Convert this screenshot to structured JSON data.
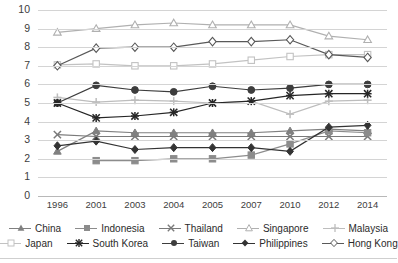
{
  "chart_data": {
    "type": "line",
    "title": "",
    "xlabel": "",
    "ylabel": "",
    "ylim": [
      0,
      10
    ],
    "ytick_step": 1,
    "grid": true,
    "legend_position": "bottom",
    "categories": [
      "1996",
      "2001",
      "2003",
      "2004",
      "2005",
      "2007",
      "2010",
      "2012",
      "2014"
    ],
    "yticks": [
      "0",
      "1",
      "2",
      "3",
      "4",
      "5",
      "6",
      "7",
      "8",
      "9",
      "10"
    ],
    "series": [
      {
        "name": "China",
        "marker": "triangle",
        "color": "#808080",
        "values": [
          2.4,
          3.5,
          3.4,
          3.4,
          3.4,
          3.4,
          3.5,
          3.6,
          3.5
        ]
      },
      {
        "name": "Indonesia",
        "marker": "square",
        "color": "#8c8c8c",
        "values": [
          null,
          1.9,
          1.9,
          2.0,
          2.0,
          2.2,
          2.8,
          3.5,
          3.4
        ]
      },
      {
        "name": "Thailand",
        "marker": "x",
        "color": "#7a7a7a",
        "values": [
          3.3,
          3.2,
          3.2,
          3.2,
          3.2,
          3.2,
          3.2,
          3.2,
          3.2
        ]
      },
      {
        "name": "Japan",
        "marker": "square-open",
        "color": "#c2c2c2",
        "values": [
          7.05,
          7.1,
          7.0,
          7.0,
          7.1,
          7.3,
          7.5,
          7.6,
          7.6
        ]
      },
      {
        "name": "South Korea",
        "marker": "star",
        "color": "#262626",
        "values": [
          5.0,
          4.2,
          4.3,
          4.5,
          5.0,
          5.1,
          5.4,
          5.5,
          5.5
        ]
      },
      {
        "name": "Taiwan",
        "marker": "circle-filled",
        "color": "#3d3d3d",
        "values": [
          5.0,
          5.95,
          5.7,
          5.6,
          5.9,
          5.7,
          5.8,
          6.0,
          6.0
        ]
      },
      {
        "name": "Singapore",
        "marker": "triangle-light",
        "color": "#b0b0b0",
        "values": [
          8.8,
          9.0,
          9.2,
          9.3,
          9.2,
          9.2,
          9.2,
          8.6,
          8.4
        ]
      },
      {
        "name": "Philippines",
        "marker": "diamond-filled",
        "color": "#333333",
        "values": [
          2.7,
          2.95,
          2.5,
          2.6,
          2.6,
          2.6,
          2.4,
          3.7,
          3.8
        ]
      },
      {
        "name": "Hong Kong",
        "marker": "diamond-open",
        "color": "#595959",
        "values": [
          7.0,
          7.95,
          8.0,
          8.0,
          8.3,
          8.3,
          8.4,
          7.6,
          7.45
        ]
      },
      {
        "name": "Malaysia",
        "marker": "plus",
        "color": "#bdbdbd",
        "values": [
          5.3,
          5.05,
          5.15,
          5.1,
          5.0,
          5.1,
          4.4,
          5.1,
          5.15
        ]
      }
    ]
  },
  "legend": {
    "row1": [
      {
        "label": "China"
      },
      {
        "label": "Indonesia"
      },
      {
        "label": "Thailand"
      },
      {
        "label": "Singapore"
      },
      {
        "label": "Malaysia"
      }
    ],
    "row2": [
      {
        "label": "Japan"
      },
      {
        "label": "South Korea"
      },
      {
        "label": "Taiwan"
      },
      {
        "label": "Philippines"
      },
      {
        "label": "Hong Kong"
      }
    ]
  }
}
